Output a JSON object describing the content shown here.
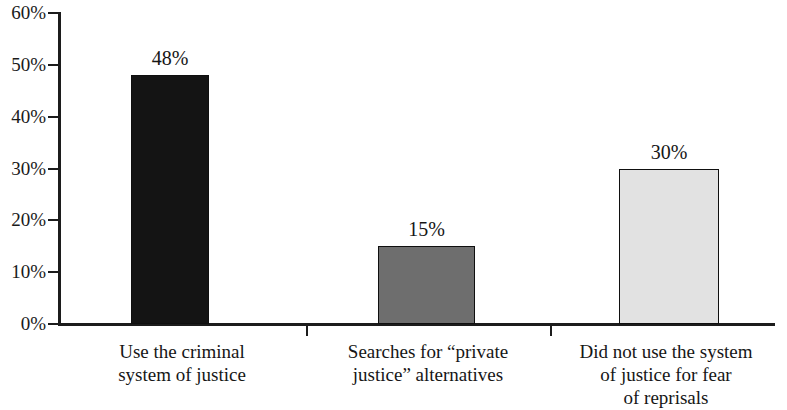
{
  "chart_data": {
    "type": "bar",
    "title": "",
    "subtitle": "",
    "xlabel": "",
    "ylabel": "",
    "categories": [
      "Use the criminal system of justice",
      "Searches for “private justice” alternatives",
      "Did not use the system of justice for fear of reprisals"
    ],
    "category_lines": [
      [
        "Use the criminal",
        "system of justice"
      ],
      [
        "Searches for “private",
        "justice” alternatives"
      ],
      [
        "Did not use the system",
        "of justice for fear",
        "of reprisals"
      ]
    ],
    "values": [
      48,
      15,
      30
    ],
    "value_labels": [
      "48%",
      "15%",
      "30%"
    ],
    "bar_colors": [
      "#141414",
      "#6e6e6e",
      "#e2e2e2"
    ],
    "ylim": [
      0,
      60
    ],
    "ytick_values": [
      0,
      10,
      20,
      30,
      40,
      50,
      60
    ],
    "ytick_labels": [
      "0%",
      "10%",
      "20%",
      "30%",
      "40%",
      "50%",
      "60%"
    ],
    "grid": false,
    "legend": false,
    "legend_position": "none",
    "axis_color": "#1c1c1c"
  }
}
